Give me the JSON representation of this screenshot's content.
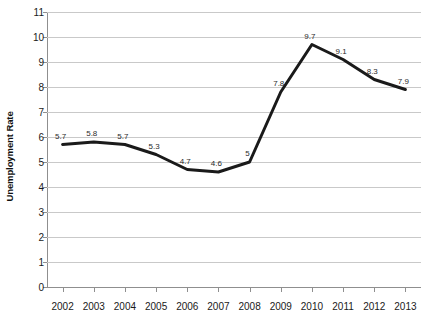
{
  "chart_data": {
    "type": "line",
    "title": "",
    "xlabel": "",
    "ylabel": "Unemployment Rate",
    "categories": [
      "2002",
      "2003",
      "2004",
      "2005",
      "2006",
      "2007",
      "2008",
      "2009",
      "2010",
      "2011",
      "2012",
      "2013"
    ],
    "values": [
      5.7,
      5.8,
      5.7,
      5.3,
      4.7,
      4.6,
      5,
      7.8,
      9.7,
      9.1,
      8.3,
      7.9
    ],
    "point_labels": [
      "5.7",
      "5.8",
      "5.7",
      "5.3",
      "4.7",
      "4.6",
      "5",
      "7.8",
      "9.7",
      "9.1",
      "8.3",
      "7.9"
    ],
    "ylim": [
      0,
      11
    ],
    "ytick_step": 1,
    "yticks": [
      "11",
      "10",
      "9",
      "8",
      "7",
      "6",
      "5",
      "4",
      "3",
      "2",
      "1",
      "0"
    ],
    "grid": true,
    "legend": false,
    "legend_position": "none",
    "series": [
      {
        "name": "Unemployment Rate",
        "color": "#1a1a1a",
        "line_width": 3,
        "markers": false,
        "values": [
          5.7,
          5.8,
          5.7,
          5.3,
          4.7,
          4.6,
          5,
          7.8,
          9.7,
          9.1,
          8.3,
          7.9
        ]
      }
    ]
  },
  "style": {
    "background": "#ffffff",
    "gridline_color": "#c9c9c9",
    "axis_color": "#8f8f8f",
    "text_color": "#1a1a1a",
    "series_color": "#1a1a1a"
  }
}
